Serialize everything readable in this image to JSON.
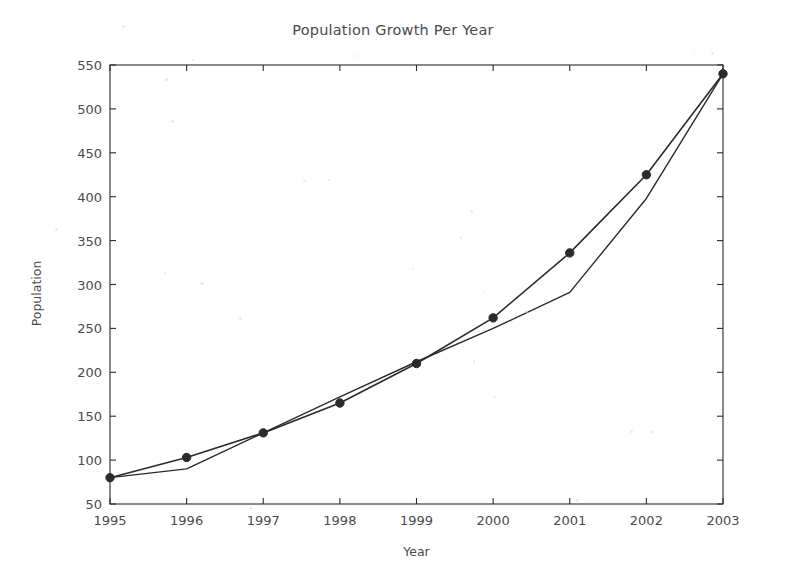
{
  "figure": {
    "background": "#ffffff",
    "ink_color": "#2b2b2b",
    "text_color": "#4a4a4a"
  },
  "chart_data": {
    "type": "line",
    "title": "Population Growth Per Year",
    "xlabel": "Year",
    "ylabel": "Population",
    "categories": [
      "1995",
      "1996",
      "1997",
      "1998",
      "1999",
      "2000",
      "2001",
      "2002",
      "2003"
    ],
    "x": [
      1995,
      1996,
      1997,
      1998,
      1999,
      2000,
      2001,
      2002,
      2003
    ],
    "xlim": [
      1995,
      2003
    ],
    "ylim": [
      50,
      550
    ],
    "yticks": [
      50,
      100,
      150,
      200,
      250,
      300,
      350,
      400,
      450,
      500,
      550
    ],
    "ytick_labels": [
      "50",
      "100",
      "150",
      "200",
      "250",
      "300",
      "350",
      "400",
      "450",
      "500",
      "550"
    ],
    "xticks": [
      1995,
      1996,
      1997,
      1998,
      1999,
      2000,
      2001,
      2002,
      2003
    ],
    "xtick_labels": [
      "1995",
      "1996",
      "1997",
      "1998",
      "1999",
      "2000",
      "2001",
      "2002",
      "2003"
    ],
    "grid": false,
    "legend": null,
    "legend_position": "none",
    "series": [
      {
        "name": "series-1",
        "marker": "circle",
        "marker_size": 4.2,
        "line_width": 1.6,
        "color": "#2b2b2b",
        "values": [
          80,
          103,
          131,
          165,
          210,
          262,
          336,
          425,
          540
        ]
      },
      {
        "name": "series-2",
        "marker": "none",
        "marker_size": 0,
        "line_width": 1.4,
        "color": "#2b2b2b",
        "values": [
          80,
          90,
          131,
          172,
          212,
          250,
          291,
          398,
          540
        ]
      }
    ]
  },
  "axes": {
    "frame_visible": true,
    "tick_direction": "out",
    "left_px": 110,
    "right_px": 723,
    "top_px": 65,
    "bottom_px": 504
  }
}
